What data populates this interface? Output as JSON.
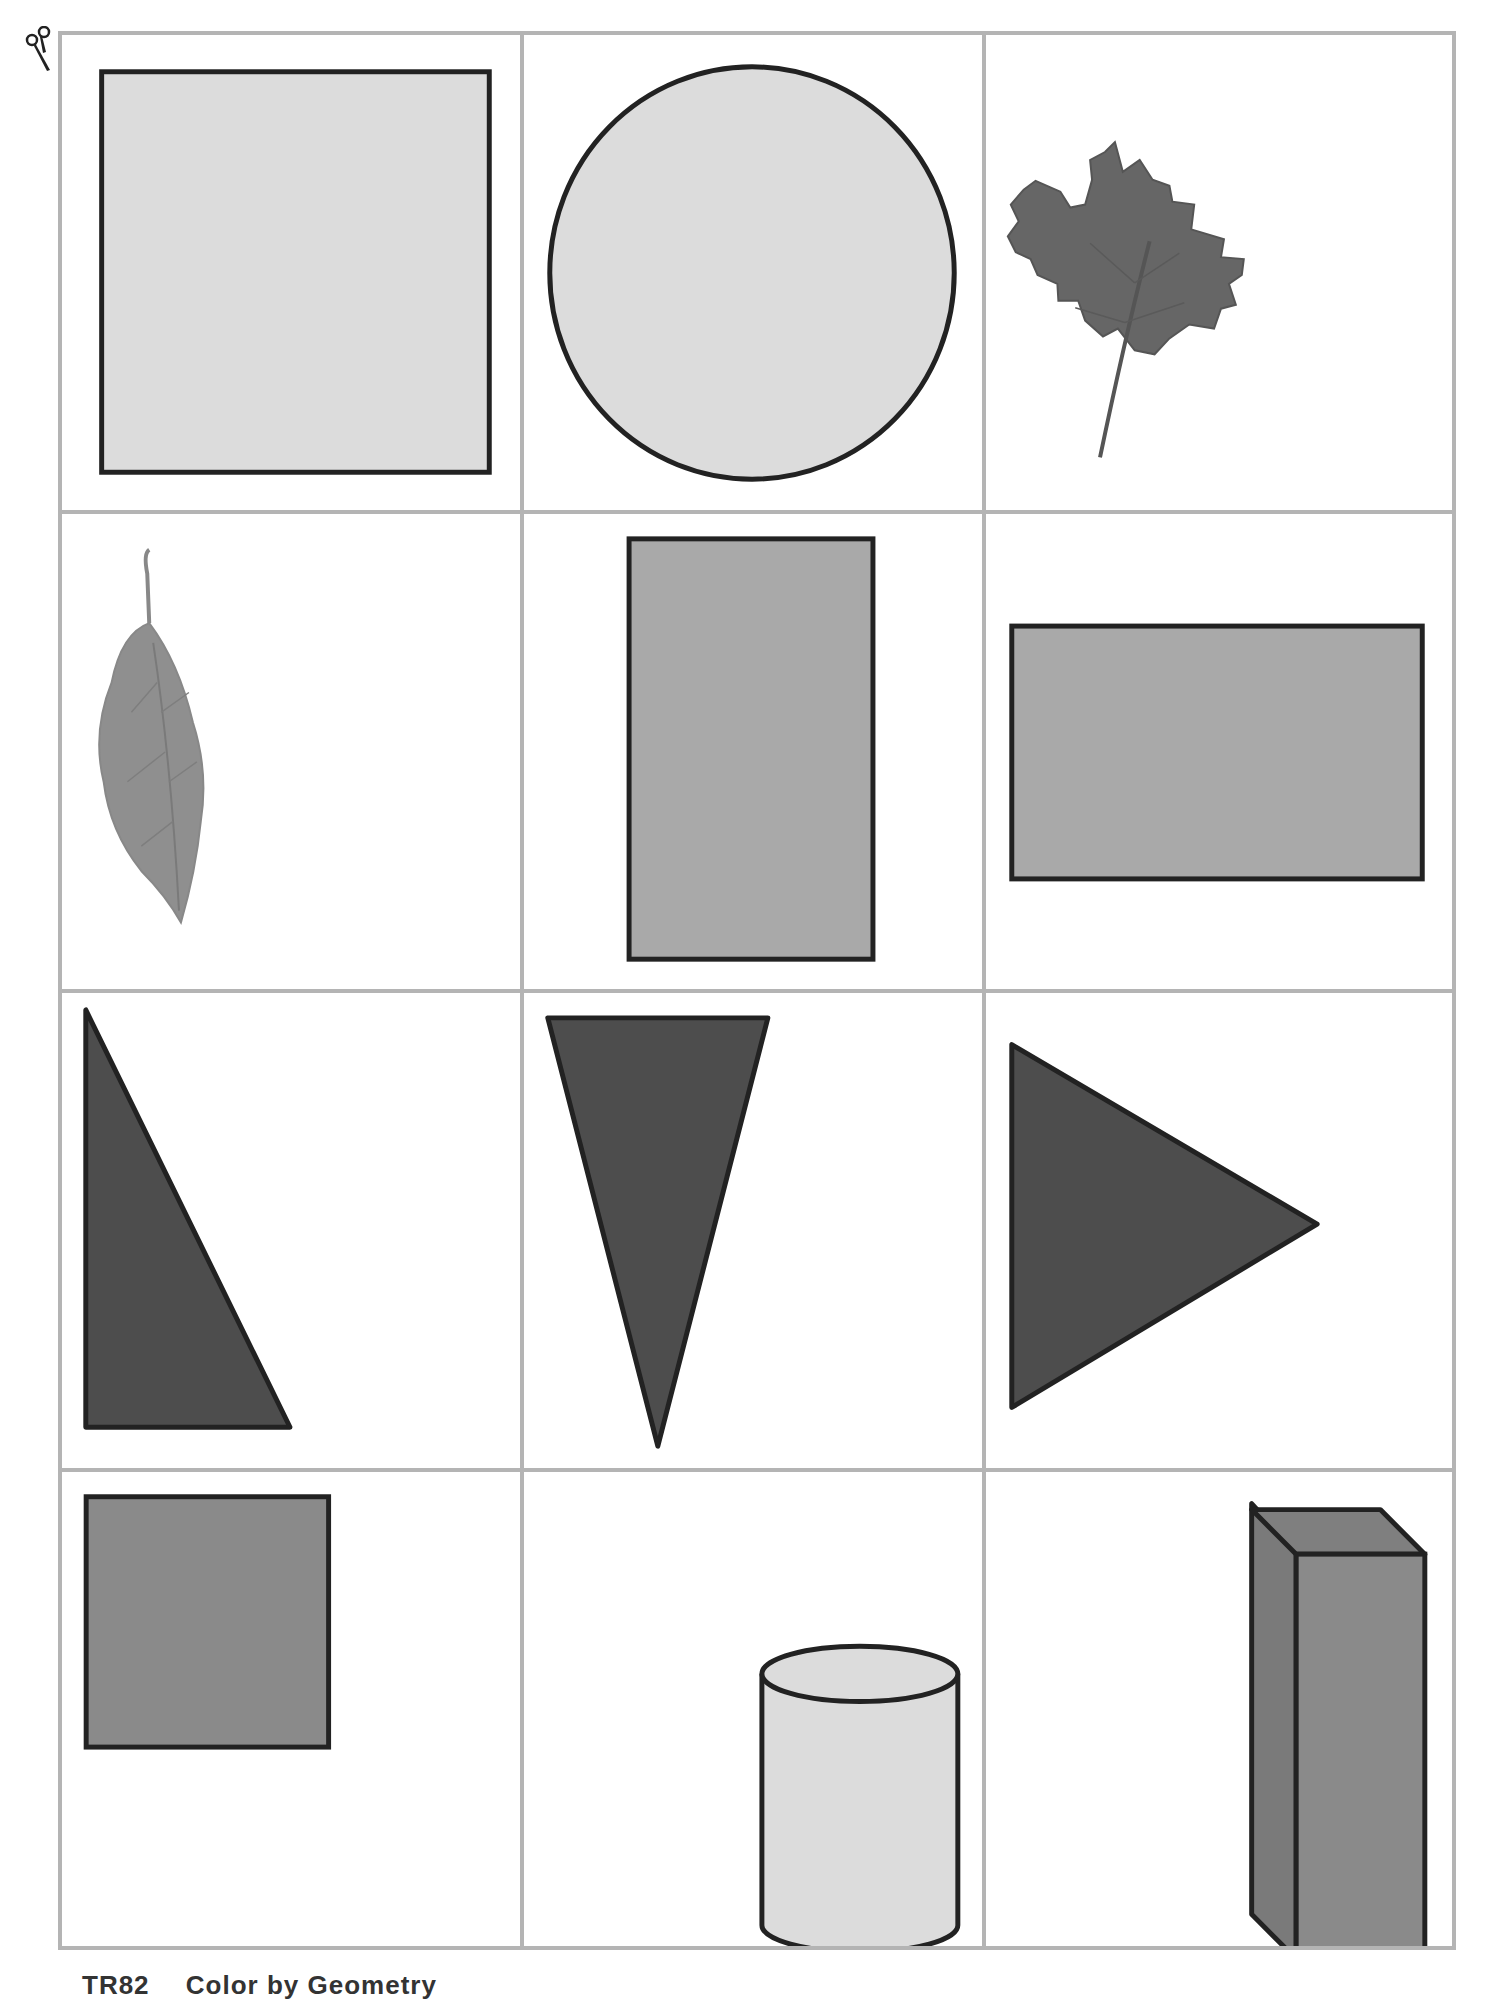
{
  "page": {
    "icons": {
      "cut_line": "scissors-icon"
    },
    "colors": {
      "grid_line": "#b4b4b4",
      "outline": "#222222",
      "light_fill": "#dcdcdc",
      "medium_fill": "#a9a9a9",
      "medium_dark_fill": "#8a8a8a",
      "dark_fill": "#4d4d4d",
      "leaf_dark": "#666666",
      "leaf_light": "#8c8c8c"
    },
    "cards": [
      {
        "row": 1,
        "col": 1,
        "shape": "square",
        "shade": "light"
      },
      {
        "row": 1,
        "col": 2,
        "shape": "circle",
        "shade": "light"
      },
      {
        "row": 1,
        "col": 3,
        "shape": "maple-leaf",
        "shade": "dark"
      },
      {
        "row": 2,
        "col": 1,
        "shape": "oval-leaf",
        "shade": "medium"
      },
      {
        "row": 2,
        "col": 2,
        "shape": "tall-rectangle",
        "shade": "medium"
      },
      {
        "row": 2,
        "col": 3,
        "shape": "wide-rectangle",
        "shade": "medium"
      },
      {
        "row": 3,
        "col": 1,
        "shape": "right-triangle",
        "shade": "dark"
      },
      {
        "row": 3,
        "col": 2,
        "shape": "inverted-isosceles-triangle",
        "shade": "dark"
      },
      {
        "row": 3,
        "col": 3,
        "shape": "right-pointing-triangle",
        "shade": "dark"
      },
      {
        "row": 4,
        "col": 1,
        "shape": "square",
        "shade": "medium-dark"
      },
      {
        "row": 4,
        "col": 2,
        "shape": "cylinder",
        "shade": "light"
      },
      {
        "row": 4,
        "col": 3,
        "shape": "rectangular-prism",
        "shade": "medium-dark"
      }
    ],
    "footer": {
      "code": "TR82",
      "title": "Color by Geometry"
    }
  }
}
